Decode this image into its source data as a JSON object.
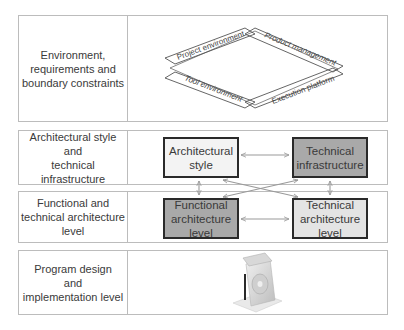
{
  "rows": [
    {
      "id": "environment",
      "label": "Environment,\nrequirements and\nboundary constraints"
    },
    {
      "id": "architecture-style",
      "label": "Architectural style\nand\ntechnical infrastructure"
    },
    {
      "id": "functional-technical",
      "label": "Functional and\ntechnical architecture\nlevel"
    },
    {
      "id": "program-design",
      "label": "Program design\nand\nimplementation level"
    }
  ],
  "environment_diamond": {
    "top_left": "Project environment",
    "top_right": "Product management",
    "bottom_left": "Tool environment",
    "bottom_right": "Execution platform"
  },
  "boxes": {
    "architectural_style": "Architectural\nstyle",
    "technical_infrastructure": "Technical\ninfrastructure",
    "functional_architecture": "Functional\narchitecture level",
    "technical_architecture": "Technical\narchitecture level"
  },
  "icons": {
    "program_design_icon": "software-package-icon"
  },
  "colors": {
    "frame_border": "#bcbcbc",
    "box_border": "#2a2a2a",
    "box_light": "#f3f3f3",
    "box_dark": "#a9a9a9",
    "arrow": "#999999"
  }
}
